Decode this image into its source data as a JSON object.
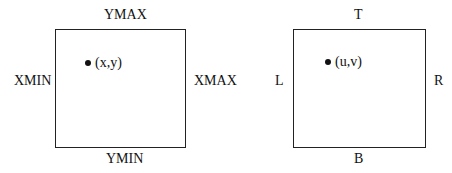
{
  "diagrams": [
    {
      "name": "world-window",
      "top": "YMAX",
      "bottom": "YMIN",
      "left": "XMIN",
      "right": "XMAX",
      "point": "(x,y)"
    },
    {
      "name": "viewport",
      "top": "T",
      "bottom": "B",
      "left": "L",
      "right": "R",
      "point": "(u,v)"
    }
  ]
}
